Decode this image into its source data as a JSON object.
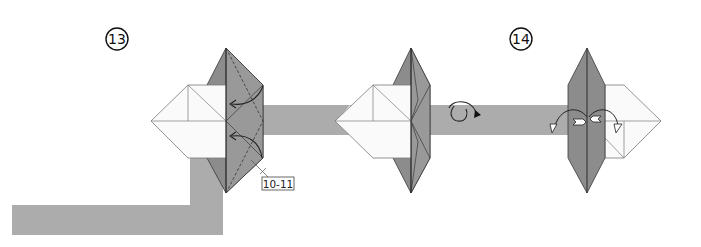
{
  "diagram": {
    "steps": [
      {
        "number": "13",
        "cx": 117,
        "cy": 39
      },
      {
        "number": "14",
        "cx": 521,
        "cy": 39
      }
    ],
    "reference_label": "10-11",
    "symbols": {
      "step13": [
        "valley-fold-arrow",
        "valley-fold-arrow",
        "dashed-fold-line"
      ],
      "step14": [
        "turn-over-icon",
        "mountain-fold-arrow",
        "mountain-fold-arrow",
        "push-arrow"
      ]
    },
    "colors": {
      "paper_white": "#fafafa",
      "paper_dark": "#8c8c8c",
      "paper_mid": "#a3a3a3",
      "band_gray": "#acacac",
      "line": "#3a3a3a"
    }
  }
}
